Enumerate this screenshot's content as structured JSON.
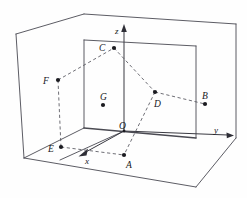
{
  "figure": {
    "type": "geometry-diagram",
    "canvas": {
      "width": 247,
      "height": 198
    },
    "colors": {
      "background": "#fefefe",
      "solid_edge": "#4a4a52",
      "dashed_edge": "#55555d",
      "axis": "#3a3a42",
      "dot": "#1b1b20",
      "label": "#16161a"
    },
    "axes": [
      {
        "name": "x-axis",
        "label": "x",
        "label_x": 86,
        "label_y": 163,
        "arrow_from_x": 95,
        "arrow_from_y": 144,
        "arrow_to_x": 79,
        "arrow_to_y": 157
      },
      {
        "name": "y-axis",
        "label": "y",
        "label_x": 215,
        "label_y": 132,
        "arrow_from_x": 127,
        "arrow_from_y": 131,
        "arrow_to_x": 232,
        "arrow_to_y": 135
      },
      {
        "name": "z-axis",
        "label": "z",
        "label_x": 116,
        "label_y": 33,
        "arrow_from_x": 124,
        "arrow_from_y": 131,
        "arrow_to_x": 124,
        "arrow_to_y": 26
      }
    ],
    "points": [
      {
        "name": "A",
        "label": "A",
        "dot_x": 124,
        "dot_y": 155,
        "label_x": 126,
        "label_y": 168
      },
      {
        "name": "B",
        "label": "B",
        "dot_x": 205,
        "dot_y": 104,
        "label_x": 202,
        "label_y": 99
      },
      {
        "name": "C",
        "label": "C",
        "dot_x": 114,
        "dot_y": 48,
        "label_x": 100,
        "label_y": 50
      },
      {
        "name": "D",
        "label": "D",
        "dot_x": 155,
        "dot_y": 92,
        "label_x": 155,
        "label_y": 106
      },
      {
        "name": "E",
        "label": "E",
        "dot_x": 61,
        "dot_y": 147,
        "label_x": 49,
        "label_y": 153
      },
      {
        "name": "F",
        "label": "F",
        "dot_x": 58,
        "dot_y": 80,
        "label_x": 44,
        "label_y": 82
      },
      {
        "name": "G",
        "label": "G",
        "dot_x": 103,
        "dot_y": 105,
        "label_x": 101,
        "label_y": 101
      }
    ],
    "dashed_connections": [
      {
        "name": "segment-F-C",
        "from": "F",
        "to": "C"
      },
      {
        "name": "segment-C-D",
        "from": "C",
        "to": "D"
      },
      {
        "name": "segment-D-B",
        "from": "D",
        "to": "B"
      },
      {
        "name": "segment-D-A",
        "from": "D",
        "to": "A"
      },
      {
        "name": "segment-F-E",
        "from": "F",
        "to": "E"
      },
      {
        "name": "segment-E-A",
        "from": "E",
        "to": "A"
      }
    ],
    "solid_edges": [
      {
        "name": "outer-box-top-back",
        "points": "84,14 236,24"
      },
      {
        "name": "outer-box-top-left",
        "points": "84,14 16,34"
      },
      {
        "name": "outer-box-left-vertical",
        "points": "16,34 24,158"
      },
      {
        "name": "outer-box-bottom-front",
        "points": "24,158 196,187"
      },
      {
        "name": "outer-box-right-vertical",
        "points": "236,24 236,138"
      },
      {
        "name": "outer-box-bottom-right",
        "points": "196,187 236,138"
      },
      {
        "name": "inner-back-top",
        "points": "84,40 196,46"
      },
      {
        "name": "inner-back-left-vertical",
        "points": "84,40 84,128"
      },
      {
        "name": "inner-back-right-vertical",
        "points": "196,46 196,138"
      },
      {
        "name": "inner-floor-left",
        "points": "84,128 24,158"
      },
      {
        "name": "inner-floor-right",
        "points": "84,128 196,138"
      }
    ],
    "floor_lines": [
      {
        "name": "floor-diagonal-from-origin",
        "points": "124,131 60,160"
      }
    ]
  }
}
